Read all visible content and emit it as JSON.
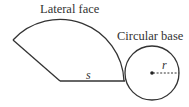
{
  "diagram": {
    "type": "cone-net",
    "labels": {
      "lateral_face": "Lateral face",
      "circular_base": "Circular base",
      "slant_height": "s",
      "radius": "r"
    },
    "colors": {
      "stroke": "#333333",
      "background": "#ffffff"
    },
    "shapes": {
      "sector": {
        "apex": [
          60,
          81
        ],
        "radius": 64,
        "start_point": [
          124,
          81
        ],
        "end_point": [
          12,
          39
        ]
      },
      "circle": {
        "center": [
          152,
          73
        ],
        "radius": 27
      }
    }
  }
}
